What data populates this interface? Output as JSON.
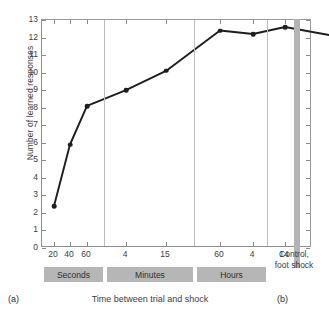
{
  "chart_data": {
    "type": "line",
    "title": "",
    "xlabel": "Time between trial and shock",
    "ylabel": "Number of learned responses",
    "ylim": [
      0,
      13
    ],
    "yticks": [
      0,
      1,
      2,
      3,
      4,
      5,
      6,
      7,
      8,
      9,
      10,
      11,
      12,
      13
    ],
    "grid": false,
    "legend": "none",
    "categories": [
      "20",
      "40",
      "60",
      "4",
      "15",
      "60",
      "4",
      "14",
      "Control, foot shock"
    ],
    "values": [
      2.4,
      5.9,
      8.1,
      9.0,
      10.1,
      12.4,
      12.2,
      12.6,
      12.1
    ],
    "series": [
      {
        "name": "Learned responses",
        "points": [
          {
            "x": "20",
            "group": "Seconds",
            "y": 2.4
          },
          {
            "x": "40",
            "group": "Seconds",
            "y": 5.9
          },
          {
            "x": "60",
            "group": "Seconds",
            "y": 8.1
          },
          {
            "x": "4",
            "group": "Minutes",
            "y": 9.0
          },
          {
            "x": "15",
            "group": "Minutes",
            "y": 10.1
          },
          {
            "x": "60",
            "group": "Minutes",
            "y": 12.4
          },
          {
            "x": "4",
            "group": "Hours",
            "y": 12.2
          },
          {
            "x": "14",
            "group": "Hours",
            "y": 12.6
          },
          {
            "x": "Control, foot shock",
            "group": "Control",
            "y": 12.1
          }
        ]
      }
    ],
    "groups": [
      {
        "label": "Seconds",
        "ticks": [
          "20",
          "40",
          "60"
        ]
      },
      {
        "label": "Minutes",
        "ticks": [
          "4",
          "15",
          "60"
        ]
      },
      {
        "label": "Hours",
        "ticks": [
          "4",
          "14"
        ]
      },
      {
        "label": "Control, foot shock",
        "ticks": []
      }
    ],
    "annotations": {
      "panel_a": "(a)",
      "panel_b": "(b)",
      "control_label": "Control,\nfoot shock"
    },
    "colors": {
      "line": "#1d1d1d",
      "marker": "#1d1d1d",
      "band": "#b6b6b6",
      "separator": "#b4b4b4",
      "axis": "#8d8d8d",
      "background": "#ffffff"
    }
  },
  "axes": {
    "y_title": "Number of learned responses",
    "x_title": "Time between trial and shock",
    "y_tick_labels": [
      "13",
      "12",
      "11",
      "10",
      "9",
      "8",
      "7",
      "6",
      "5",
      "4",
      "3",
      "2",
      "1",
      "0"
    ]
  },
  "x_tick_labels": [
    "20",
    "40",
    "60",
    "4",
    "15",
    "60",
    "4",
    "14"
  ],
  "bands": [
    {
      "label": "Seconds"
    },
    {
      "label": "Minutes"
    },
    {
      "label": "Hours"
    }
  ],
  "control": {
    "line1": "Control,",
    "line2": "foot shock"
  },
  "captions": {
    "panel_a": "(a)",
    "panel_b": "(b)"
  }
}
